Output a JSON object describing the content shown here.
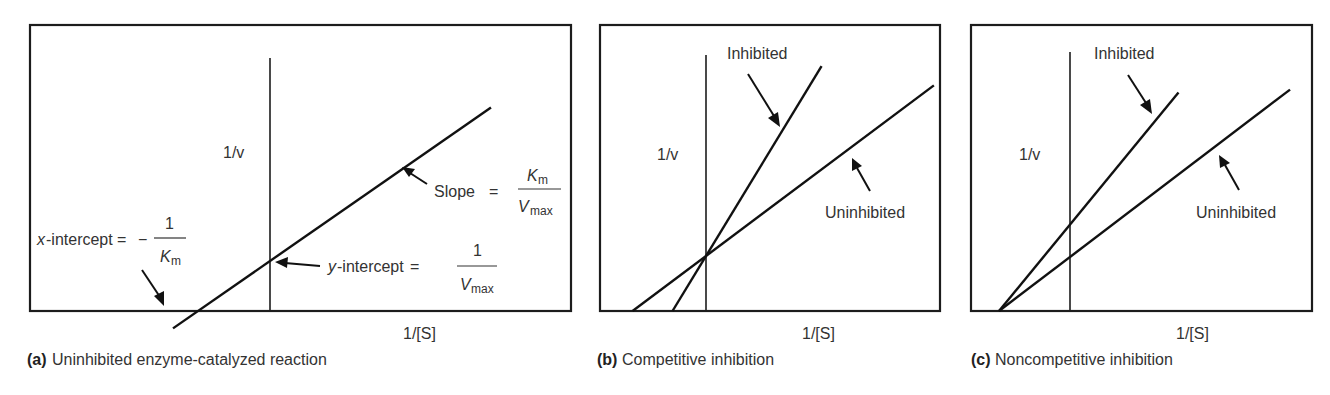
{
  "figure": {
    "panels": [
      {
        "id": "a",
        "caption_tag": "(a)",
        "caption_text": "Uninhibited enzyme-catalyzed reaction",
        "ylabel": "1/v",
        "xlabel": "1/[S]",
        "annotations": {
          "slope_label": "Slope",
          "slope_equals": "=",
          "slope_num": "K",
          "slope_num_sub": "m",
          "slope_den": "V",
          "slope_den_sub": "max",
          "xint_label_var": "x",
          "xint_label_rest": "-intercept",
          "xint_equals": "=",
          "xint_minus": "−",
          "xint_num": "1",
          "xint_den": "K",
          "xint_den_sub": "m",
          "yint_label_var": "y",
          "yint_label_rest": "-intercept",
          "yint_equals": "=",
          "yint_num": "1",
          "yint_den": "V",
          "yint_den_sub": "max"
        }
      },
      {
        "id": "b",
        "caption_tag": "(b)",
        "caption_text": "Competitive inhibition",
        "ylabel": "1/v",
        "xlabel": "1/[S]",
        "inhibited_label": "Inhibited",
        "uninhibited_label": "Uninhibited"
      },
      {
        "id": "c",
        "caption_tag": "(c)",
        "caption_text": "Noncompetitive inhibition",
        "ylabel": "1/v",
        "xlabel": "1/[S]",
        "inhibited_label": "Inhibited",
        "uninhibited_label": "Uninhibited"
      }
    ]
  },
  "chart_data": [
    {
      "type": "line",
      "title": "(a) Uninhibited enzyme-catalyzed reaction",
      "xlabel": "1/[S]",
      "ylabel": "1/v",
      "grid": false,
      "axes_units": "arbitrary (Lineweaver-Burk double-reciprocal plot, y-intercept of uninhibited line = 1)",
      "series": [
        {
          "name": "Uninhibited",
          "x_intercept": -1.44,
          "y_intercept": 1.0,
          "x_range": [
            -1.94,
            4.42
          ]
        }
      ],
      "xlim": [
        -4.8,
        6.0
      ],
      "ylim": [
        -0.4,
        4.2
      ]
    },
    {
      "type": "line",
      "title": "(b) Competitive inhibition",
      "xlabel": "1/[S]",
      "ylabel": "1/v",
      "grid": false,
      "series": [
        {
          "name": "Inhibited",
          "x_intercept": -0.62,
          "y_intercept": 1.0,
          "x_range": [
            -0.62,
            2.14
          ]
        },
        {
          "name": "Uninhibited",
          "x_intercept": -1.36,
          "y_intercept": 1.0,
          "x_range": [
            -1.36,
            4.22
          ]
        }
      ],
      "xlim": [
        -2.1,
        4.7
      ],
      "ylim": [
        0,
        5.7
      ]
    },
    {
      "type": "line",
      "title": "(c) Noncompetitive inhibition",
      "xlabel": "1/[S]",
      "ylabel": "1/v",
      "grid": false,
      "series": [
        {
          "name": "Inhibited",
          "x_intercept": -1.4,
          "y_intercept": 1.6,
          "x_range": [
            -1.4,
            2.14
          ]
        },
        {
          "name": "Uninhibited",
          "x_intercept": -1.4,
          "y_intercept": 1.0,
          "x_range": [
            -1.4,
            4.34
          ]
        }
      ],
      "xlim": [
        -1.98,
        4.84
      ],
      "ylim": [
        0,
        5.7
      ]
    }
  ]
}
